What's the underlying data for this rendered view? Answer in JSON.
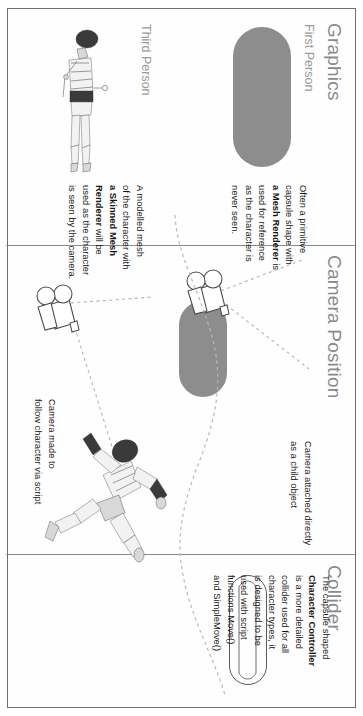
{
  "diagram": {
    "columns": [
      {
        "id": "graphics",
        "label": "Graphics"
      },
      {
        "id": "camera-position",
        "label": "Camera Position"
      },
      {
        "id": "collider",
        "label": "Collider"
      }
    ],
    "rows": [
      {
        "id": "first-person",
        "label": "First Person"
      },
      {
        "id": "third-person",
        "label": "Third Person"
      }
    ],
    "notes": {
      "first_person_graphics": {
        "lines": [
          "Often a primitive",
          "capsule shape with",
          "a Mesh Renderer is",
          "used for reference",
          "as the character is",
          "never seen."
        ],
        "bold_terms": [
          "a Mesh Renderer"
        ],
        "plain": "Often a primitive capsule shape with a Mesh Renderer is used for reference as the character is never seen."
      },
      "third_person_graphics": {
        "lines": [
          "A modelled mesh",
          "of the character with",
          "a Skinned Mesh",
          "Renderer will be",
          "used as the character",
          "is seen by the camera."
        ],
        "bold_terms": [
          "a Skinned Mesh Renderer"
        ],
        "plain": "A modelled mesh of the character with a Skinned Mesh Renderer will be used as the character is seen by the camera."
      },
      "first_person_camera": {
        "lines": [
          "Camera attached directly",
          "as a child object"
        ],
        "plain": "Camera attached directly as a child object"
      },
      "third_person_camera": {
        "lines": [
          "Camera made to",
          "follow character via script"
        ],
        "plain": "Camera made to follow character via script"
      },
      "collider": {
        "lines": [
          "The capsule shaped",
          "Character Controller",
          "is a more detailed",
          "collider used for all",
          "character types, it",
          "is designed to be",
          "used with script",
          "functions Move()",
          "and SimpleMove()"
        ],
        "bold_terms": [
          "Character Controller"
        ],
        "plain": "The capsule shaped Character Controller is a more detailed collider used for all character types, it is designed to be used with script functions Move() and SimpleMove()"
      }
    },
    "figures": {
      "first_person_capsule": "gray-filled-capsule",
      "third_person_mesh": "standing-character-mesh",
      "first_person_camera_rig": "camera-icon-with-capsule",
      "third_person_camera_rig": "camera-icon-standalone",
      "third_person_character": "running-character-mesh",
      "collider_capsule": "capsule-outline-collider",
      "ground": "dashed-terrain-line"
    },
    "colors": {
      "heading": "#8a8a8a",
      "sublabel": "#9a9a9a",
      "body_text": "#151515",
      "capsule_fill": "#8d8d8d",
      "dashed_line": "#b3b3b3",
      "border": "#6e6e6e"
    }
  }
}
